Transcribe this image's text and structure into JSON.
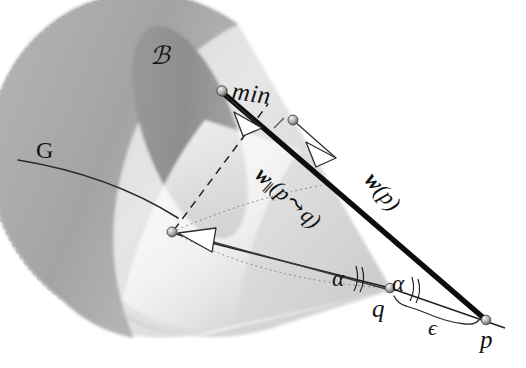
{
  "figure": {
    "background_color": "#ffffff",
    "ink_color": "#121212",
    "cone_light_color": "#d9d9d9",
    "cone_mid_color": "#bfbfbf",
    "cone_dark_color": "#8f8f8f",
    "labels": {
      "cone_name": "ℬ",
      "geodesic_name": "G",
      "min_label": "min",
      "vector_parallel_w": "w",
      "vector_parallel_sub": "∥",
      "vector_parallel_arg_open": "(p",
      "vector_parallel_arrow": "⤳",
      "vector_parallel_arg_close": "q)",
      "vector_w_of_p": "w",
      "vector_w_of_p_arg": "(p)",
      "point_q": "q",
      "point_p": "p",
      "angle_left": "α",
      "angle_right": "α",
      "epsilon": "ϵ"
    },
    "nodes": [
      {
        "name": "cone-rim-node",
        "x": 222,
        "y": 91
      },
      {
        "name": "min-midpoint-node",
        "x": 293,
        "y": 120
      },
      {
        "name": "cone-interior-node",
        "x": 172,
        "y": 232
      },
      {
        "name": "point-q-node",
        "x": 390,
        "y": 288
      },
      {
        "name": "point-p-node",
        "x": 486,
        "y": 320
      }
    ],
    "segments": [
      {
        "name": "thick-min-segment",
        "from": "cone-rim-node",
        "to": "min-midpoint-node",
        "style": "thick-solid"
      },
      {
        "name": "thick-w-of-p-segment",
        "from": "cone-rim-node",
        "to": "point-p-node",
        "style": "thick-solid"
      },
      {
        "name": "thin-q-to-p-segment",
        "from": "point-q-node",
        "to": "point-p-node",
        "style": "thin-solid"
      },
      {
        "name": "thin-interior-to-q-segment",
        "from": "cone-interior-node",
        "to": "point-q-node",
        "style": "thin-solid"
      },
      {
        "name": "dashed-interior-to-rim-segment",
        "from": "cone-interior-node",
        "to": "cone-rim-node",
        "style": "dashed"
      },
      {
        "name": "dotted-interior-to-q-segment",
        "from": "cone-interior-node",
        "to": "point-q-node",
        "style": "dotted"
      },
      {
        "name": "geodesic-line-G",
        "style": "thin-curve"
      }
    ],
    "arrowheads": [
      {
        "name": "arrowhead-min-from-rim",
        "at_x": 248,
        "at_y": 122
      },
      {
        "name": "arrowhead-min-from-mid",
        "at_x": 322,
        "at_y": 152
      },
      {
        "name": "arrowhead-interior-vector",
        "at_x": 206,
        "at_y": 242
      }
    ],
    "angle_marks": [
      {
        "name": "angle-mark-left",
        "x": 356,
        "y": 281
      },
      {
        "name": "angle-mark-right",
        "x": 415,
        "y": 295
      }
    ]
  }
}
